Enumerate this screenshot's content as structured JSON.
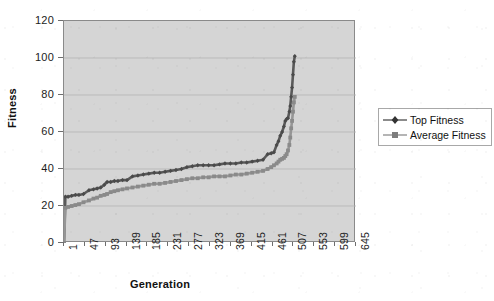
{
  "chart_data": {
    "type": "line",
    "title": "",
    "xlabel": "Generation",
    "ylabel": "Fitness",
    "xlim": [
      1,
      645
    ],
    "ylim": [
      0,
      120
    ],
    "grid": true,
    "legend_position": "right",
    "xticks": [
      "1",
      "47",
      "93",
      "139",
      "185",
      "231",
      "277",
      "323",
      "369",
      "415",
      "461",
      "507",
      "553",
      "599",
      "645"
    ],
    "yticks": [
      "0",
      "20",
      "40",
      "60",
      "80",
      "100",
      "120"
    ],
    "colors": {
      "top_fitness": "#5a5a5a",
      "average_fitness": "#969696",
      "plot_background": "#d5d5d5",
      "gridline": "#b4b4b4",
      "axis": "#8a8a8a",
      "text": "#1c1c1c",
      "page_background": "#ffffff"
    },
    "series": [
      {
        "name": "Top Fitness",
        "marker": "diamond",
        "x": [
          1,
          4,
          10,
          18,
          26,
          34,
          44,
          56,
          66,
          74,
          82,
          90,
          96,
          104,
          112,
          120,
          130,
          140,
          152,
          164,
          176,
          188,
          200,
          212,
          224,
          236,
          248,
          260,
          272,
          284,
          296,
          308,
          320,
          332,
          344,
          356,
          368,
          380,
          392,
          404,
          416,
          428,
          440,
          450,
          458,
          464,
          470,
          474,
          478,
          482,
          486,
          489,
          492,
          495,
          498,
          500,
          502,
          504,
          506,
          508,
          510
        ],
        "y": [
          0,
          25,
          25,
          25.5,
          26,
          26,
          26.5,
          28.5,
          29,
          29.5,
          30,
          31.5,
          33,
          33,
          33.5,
          33.5,
          34,
          34,
          36,
          36.5,
          37,
          37.5,
          38,
          38,
          38.5,
          39,
          39.5,
          40,
          41,
          41.5,
          42,
          42,
          42,
          42,
          42.5,
          43,
          43,
          43,
          43.5,
          43.5,
          44,
          44.5,
          45,
          48,
          48.5,
          49,
          53,
          55,
          58,
          60,
          63,
          66,
          67,
          67.5,
          71,
          74,
          79,
          84,
          91,
          98,
          101
        ]
      },
      {
        "name": "Average Fitness",
        "marker": "square",
        "x": [
          1,
          4,
          10,
          18,
          26,
          34,
          44,
          56,
          66,
          74,
          82,
          90,
          96,
          104,
          112,
          120,
          130,
          140,
          152,
          164,
          176,
          188,
          200,
          212,
          224,
          236,
          248,
          260,
          272,
          284,
          296,
          308,
          320,
          332,
          344,
          356,
          368,
          380,
          392,
          404,
          416,
          428,
          440,
          450,
          458,
          464,
          470,
          474,
          478,
          482,
          486,
          489,
          492,
          495,
          498,
          500,
          502,
          504,
          506,
          508,
          510
        ],
        "y": [
          0,
          19,
          19.5,
          20,
          20.5,
          21,
          22,
          23,
          24,
          24.5,
          25.5,
          26,
          26.5,
          27.5,
          28,
          28.5,
          29,
          29.5,
          30,
          30.5,
          31,
          31.5,
          32,
          32,
          32.5,
          33,
          33.5,
          34,
          34.5,
          35,
          35,
          35.5,
          35.5,
          36,
          36,
          36,
          36.5,
          37,
          37,
          37.5,
          38,
          38.5,
          39,
          40,
          41,
          42,
          43,
          44,
          45,
          45.5,
          46,
          47,
          48,
          50,
          53,
          57,
          62,
          66,
          71,
          76,
          79
        ]
      }
    ]
  },
  "legend": {
    "items": [
      {
        "label": "Top Fitness",
        "marker": "diamond",
        "color": "#5a5a5a"
      },
      {
        "label": "Average Fitness",
        "marker": "square",
        "color": "#969696"
      }
    ]
  }
}
